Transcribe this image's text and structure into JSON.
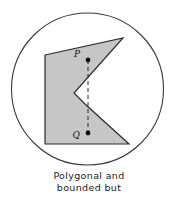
{
  "figure": {
    "caption_lines": [
      "Polygonal and",
      "bounded but"
    ],
    "colors": {
      "polygon_fill": "#c6c6c6",
      "polygon_stroke": "#2b2b2b",
      "circle_stroke": "#3a3a3a",
      "circle_fill": "#ffffff",
      "dash_stroke": "#2b2b2b",
      "point_fill": "#111111",
      "text": "#1a1a1a"
    },
    "circle": {
      "cx": 87.5,
      "cy": 89,
      "r": 76,
      "stroke_width": 1.1
    },
    "polygon": {
      "name": "concave-polygon",
      "points": "45,55 123,38 74,93 85,104 129,144 45,144",
      "stroke_width": 1.2
    },
    "points": [
      {
        "id": "P",
        "label": "P",
        "x": 88,
        "y": 60,
        "label_x": 80,
        "label_y": 57,
        "r": 2.4
      },
      {
        "id": "Q",
        "label": "Q",
        "x": 88,
        "y": 133,
        "label_x": 79,
        "label_y": 138,
        "r": 2.4
      }
    ],
    "dashed_segment": {
      "x1": 88,
      "y1": 60,
      "x2": 88,
      "y2": 133,
      "dash_pattern": "4,3",
      "stroke_width": 1
    }
  }
}
